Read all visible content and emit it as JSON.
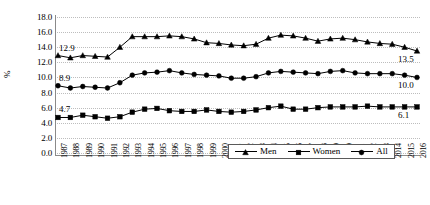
{
  "chart_data": {
    "type": "line",
    "title": "",
    "xlabel": "",
    "ylabel": "%",
    "ylim": [
      0.0,
      18.0
    ],
    "ytick_step": 2.0,
    "ytick_labels": [
      "18.0",
      "16.0",
      "14.0",
      "12.0",
      "10.0",
      "8.0",
      "6.0",
      "4.0",
      "2.0",
      "0.0"
    ],
    "grid": true,
    "legend_position": "bottom-right",
    "categories": [
      "1987",
      "1988",
      "1989",
      "1990",
      "1991",
      "1992",
      "1993",
      "1994",
      "1995",
      "1996",
      "1997",
      "1998",
      "1999",
      "2000",
      "2001",
      "2002",
      "2003",
      "2004",
      "2005",
      "2006",
      "2007",
      "2008",
      "2009",
      "2010",
      "2011",
      "2012",
      "2013",
      "2014",
      "2015",
      "2016"
    ],
    "series": [
      {
        "name": "Men",
        "marker": "triangle",
        "values": [
          12.9,
          12.6,
          12.9,
          12.8,
          12.7,
          14.0,
          15.4,
          15.4,
          15.4,
          15.5,
          15.4,
          15.1,
          14.6,
          14.5,
          14.3,
          14.2,
          14.4,
          15.2,
          15.6,
          15.5,
          15.2,
          14.8,
          15.1,
          15.2,
          15.0,
          14.7,
          14.5,
          14.4,
          14.0,
          13.5
        ],
        "start_label": "12.9",
        "end_label": "13.5"
      },
      {
        "name": "Women",
        "marker": "square",
        "values": [
          4.7,
          4.7,
          5.0,
          4.8,
          4.6,
          4.8,
          5.4,
          5.8,
          5.9,
          5.6,
          5.5,
          5.5,
          5.7,
          5.5,
          5.4,
          5.5,
          5.7,
          6.0,
          6.2,
          5.8,
          5.8,
          6.0,
          6.1,
          6.1,
          6.1,
          6.2,
          6.1,
          6.1,
          6.1,
          6.1
        ],
        "start_label": "4.7",
        "end_label": "6.1"
      },
      {
        "name": "All",
        "marker": "circle",
        "values": [
          8.9,
          8.6,
          8.8,
          8.7,
          8.6,
          9.3,
          10.3,
          10.6,
          10.7,
          10.9,
          10.6,
          10.4,
          10.3,
          10.2,
          9.9,
          9.9,
          10.1,
          10.6,
          10.8,
          10.7,
          10.6,
          10.5,
          10.8,
          10.9,
          10.6,
          10.5,
          10.5,
          10.5,
          10.3,
          10.0
        ],
        "start_label": "8.9",
        "end_label": "10.0"
      }
    ]
  },
  "legend": {
    "items": [
      {
        "label": "Men",
        "marker": "triangle"
      },
      {
        "label": "Women",
        "marker": "square"
      },
      {
        "label": "All",
        "marker": "circle"
      }
    ]
  }
}
